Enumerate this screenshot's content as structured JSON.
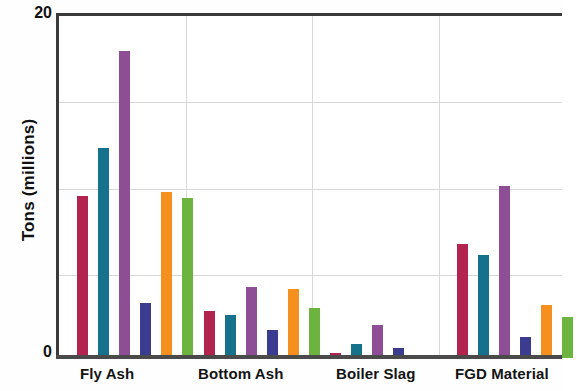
{
  "chart_data": {
    "type": "bar",
    "title": "",
    "xlabel": "",
    "ylabel": "Tons (millions)",
    "ylim": [
      0,
      20
    ],
    "yticks": [
      0,
      20
    ],
    "ytick_labels": [
      "0",
      "20"
    ],
    "gridlines_y": [
      5,
      10,
      15
    ],
    "grid": true,
    "legend_position": "none",
    "categories": [
      "Fly Ash",
      "Bottom Ash",
      "Boiler Slag",
      "FGD Material"
    ],
    "series": [
      {
        "name": "series-1",
        "color": "#B2234F",
        "values": [
          9.4,
          2.7,
          0.3,
          6.6
        ]
      },
      {
        "name": "series-2",
        "color": "#16718C",
        "values": [
          12.2,
          2.5,
          0.8,
          6.0
        ]
      },
      {
        "name": "series-3",
        "color": "#8E4E95",
        "values": [
          17.8,
          4.1,
          1.9,
          10.0
        ]
      },
      {
        "name": "series-4",
        "color": "#3B3B8F",
        "values": [
          3.2,
          1.6,
          0.6,
          1.2
        ]
      },
      {
        "name": "series-5",
        "color": "#F5901F",
        "values": [
          9.6,
          4.0,
          0.2,
          3.1
        ]
      },
      {
        "name": "series-6",
        "color": "#6DB33F",
        "values": [
          9.3,
          2.9,
          0.0,
          2.4
        ]
      }
    ]
  },
  "axis": {
    "y_label": "Tons (millions)",
    "y_top_label": "20",
    "y_zero_label": "0"
  },
  "categories": {
    "fly_ash": "Fly Ash",
    "bottom_ash": "Bottom Ash",
    "boiler_slag": "Boiler Slag",
    "fgd_material": "FGD Material"
  }
}
